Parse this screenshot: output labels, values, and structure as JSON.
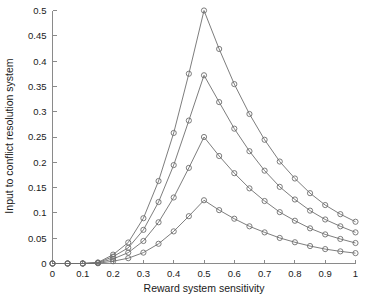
{
  "chart_data": {
    "type": "line",
    "title": "",
    "subtitle": "",
    "xlabel": "Reward system sensitivity",
    "ylabel": "Input to conflict resolution system",
    "xlim": [
      0,
      1
    ],
    "ylim": [
      0,
      0.5
    ],
    "grid": false,
    "legend": "none",
    "marker": "open-circle",
    "line_color": "#6e6e6e",
    "axis_color": "#8a8a8a",
    "xticks": [
      0,
      0.1,
      0.2,
      0.3,
      0.4,
      0.5,
      0.6,
      0.7,
      0.8,
      0.9,
      1
    ],
    "xtick_labels": [
      "0",
      "0.1",
      "0.2",
      "0.3",
      "0.4",
      "0.5",
      "0.6",
      "0.7",
      "0.8",
      "0.9",
      "1"
    ],
    "yticks": [
      0,
      0.05,
      0.1,
      0.15,
      0.2,
      0.25,
      0.3,
      0.35,
      0.4,
      0.45,
      0.5
    ],
    "ytick_labels": [
      "0",
      "0.05",
      "0.1",
      "0.15",
      "0.2",
      "0.25",
      "0.3",
      "0.35",
      "0.4",
      "0.45",
      "0.5"
    ],
    "x": [
      0,
      0.05,
      0.1,
      0.15,
      0.2,
      0.25,
      0.3,
      0.35,
      0.4,
      0.45,
      0.5,
      0.55,
      0.6,
      0.65,
      0.7,
      0.75,
      0.8,
      0.85,
      0.9,
      0.95,
      1
    ],
    "series": [
      {
        "name": "curve-1",
        "values": [
          0,
          0,
          0,
          0.002,
          0.0175,
          0.0415,
          0.0895,
          0.163,
          0.258,
          0.375,
          0.5,
          0.424,
          0.3545,
          0.2955,
          0.2445,
          0.2015,
          0.168,
          0.139,
          0.1155,
          0.0975,
          0.0825
        ]
      },
      {
        "name": "curve-2",
        "values": [
          0,
          0,
          0,
          0.0015,
          0.0135,
          0.031,
          0.0665,
          0.1215,
          0.1945,
          0.2825,
          0.372,
          0.319,
          0.2665,
          0.222,
          0.1835,
          0.1515,
          0.1265,
          0.1045,
          0.087,
          0.0735,
          0.0615
        ]
      },
      {
        "name": "curve-3",
        "values": [
          0,
          0,
          0,
          0.001,
          0.009,
          0.0215,
          0.0445,
          0.0815,
          0.1305,
          0.189,
          0.25,
          0.2125,
          0.1785,
          0.1485,
          0.1235,
          0.1015,
          0.0845,
          0.0695,
          0.0575,
          0.0485,
          0.0405
        ]
      },
      {
        "name": "curve-4",
        "values": [
          0,
          0,
          0,
          0.0005,
          0.0045,
          0.0105,
          0.0215,
          0.039,
          0.0635,
          0.0935,
          0.125,
          0.1055,
          0.0885,
          0.0735,
          0.0615,
          0.0505,
          0.042,
          0.0345,
          0.0285,
          0.024,
          0.0205
        ]
      }
    ]
  }
}
